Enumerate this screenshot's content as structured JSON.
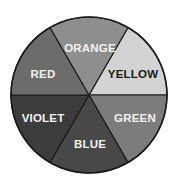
{
  "diagram": {
    "type": "color-wheel",
    "center": {
      "x": 89,
      "y": 95
    },
    "radius": 78,
    "outline_color": "#1a1a1a",
    "segments": [
      {
        "name": "YELLOW",
        "fill": "#d3d3d3",
        "text_color": "#1a1a1a",
        "path": "M89,95 L128,27.45 A78,78 0 0,1 167,95 Z",
        "label_x": 133,
        "label_y": 74
      },
      {
        "name": "GREEN",
        "fill": "#7c7c7c",
        "text_color": "#f2f2f2",
        "path": "M89,95 L167,95 A78,78 0 0,1 128,162.55 Z",
        "label_x": 135,
        "label_y": 118
      },
      {
        "name": "BLUE",
        "fill": "#484848",
        "text_color": "#f2f2f2",
        "path": "M89,95 L128,162.55 A78,78 0 0,1 50,162.55 Z",
        "label_x": 90,
        "label_y": 144
      },
      {
        "name": "VIOLET",
        "fill": "#3c3c3c",
        "text_color": "#f2f2f2",
        "path": "M89,95 L50,162.55 A78,78 0 0,1 11,95 Z",
        "label_x": 43,
        "label_y": 118
      },
      {
        "name": "RED",
        "fill": "#6c6c6c",
        "text_color": "#f2f2f2",
        "path": "M89,95 L11,95 A78,78 0 0,1 50,27.45 Z",
        "label_x": 43,
        "label_y": 74
      },
      {
        "name": "ORANGE",
        "fill": "#8e8e8e",
        "text_color": "#f2f2f2",
        "path": "M89,95 L50,27.45 A78,78 0 0,1 128,27.45 Z",
        "label_x": 90,
        "label_y": 48
      }
    ]
  }
}
